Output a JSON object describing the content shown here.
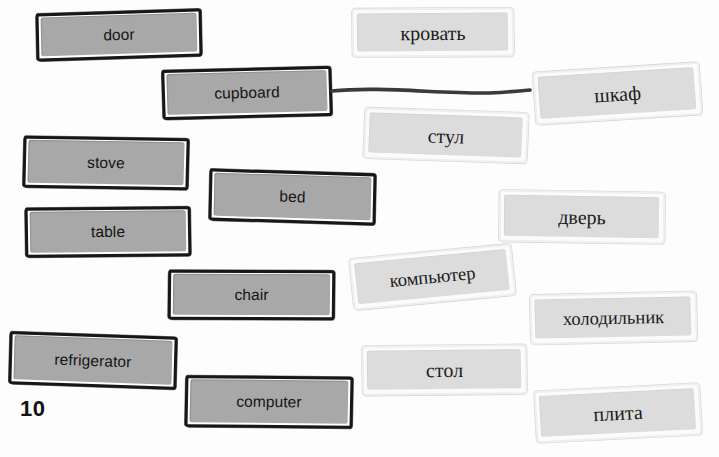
{
  "worksheet": {
    "page_number": "10",
    "english_cards": [
      {
        "label": "door",
        "left": 36,
        "top": 11,
        "width": 166,
        "height": 48,
        "rotate": -1.2,
        "skew": -0.6
      },
      {
        "label": "cupboard",
        "left": 162,
        "top": 68,
        "width": 170,
        "height": 50,
        "rotate": -1.8,
        "skew": 0.4
      },
      {
        "label": "stove",
        "left": 23,
        "top": 137,
        "width": 166,
        "height": 52,
        "rotate": 1.4,
        "skew": -0.5
      },
      {
        "label": "bed",
        "left": 209,
        "top": 171,
        "width": 167,
        "height": 52,
        "rotate": 1.2,
        "skew": 0.5
      },
      {
        "label": "table",
        "left": 25,
        "top": 207,
        "width": 166,
        "height": 50,
        "rotate": -0.9,
        "skew": 0.4
      },
      {
        "label": "chair",
        "left": 168,
        "top": 270,
        "width": 167,
        "height": 50,
        "rotate": 0.6,
        "skew": -0.4
      },
      {
        "label": "refrigerator",
        "left": 9,
        "top": 334,
        "width": 168,
        "height": 53,
        "rotate": 1.5,
        "skew": 0.5
      },
      {
        "label": "computer",
        "left": 185,
        "top": 376,
        "width": 168,
        "height": 52,
        "rotate": 1.1,
        "skew": -0.5
      }
    ],
    "russian_cards": [
      {
        "label": "кровать",
        "left": 352,
        "top": 8,
        "width": 162,
        "height": 49,
        "rotate": -0.8,
        "skew": 0.5,
        "small": false
      },
      {
        "label": "шкаф",
        "left": 534,
        "top": 67,
        "width": 167,
        "height": 53,
        "rotate": -4.2,
        "skew": 0.6,
        "small": false
      },
      {
        "label": "стул",
        "left": 364,
        "top": 110,
        "width": 164,
        "height": 51,
        "rotate": 2.4,
        "skew": -0.5,
        "small": false
      },
      {
        "label": "дверь",
        "left": 499,
        "top": 191,
        "width": 166,
        "height": 52,
        "rotate": 0.5,
        "skew": 0.4,
        "small": false
      },
      {
        "label": "компьютер",
        "left": 351,
        "top": 251,
        "width": 163,
        "height": 52,
        "rotate": -6.0,
        "skew": 0.6,
        "small": true
      },
      {
        "label": "холодильник",
        "left": 530,
        "top": 293,
        "width": 167,
        "height": 50,
        "rotate": -1.6,
        "skew": 0.4,
        "small": true
      },
      {
        "label": "стол",
        "left": 362,
        "top": 345,
        "width": 165,
        "height": 50,
        "rotate": -1.0,
        "skew": 0.4,
        "small": false
      },
      {
        "label": "плита",
        "left": 535,
        "top": 387,
        "width": 166,
        "height": 52,
        "rotate": -3.4,
        "skew": 0.5,
        "small": false
      }
    ],
    "connections": [
      {
        "from_label": "cupboard",
        "to_label": "шкаф",
        "path": "M 332 91 C 380 86, 440 94, 490 93 C 508 92, 520 91, 530 90"
      }
    ],
    "colors": {
      "english_card_fill": "#a8a8a8",
      "english_card_border": "#15171a",
      "russian_card_fill": "#dcdcdc",
      "russian_card_border": "#efefef",
      "connector_line": "#3a3a3a",
      "page_background": "#fdfdfd",
      "text": "#141414"
    }
  }
}
